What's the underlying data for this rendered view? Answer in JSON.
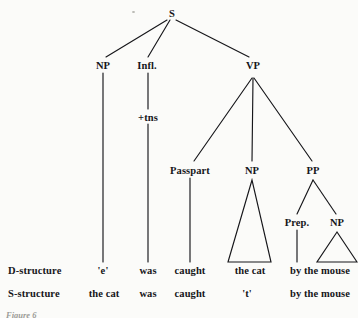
{
  "figure": {
    "caption": "Figure 6",
    "ink_color": "#16161a",
    "background_color": "#fbfbf9"
  },
  "tree": {
    "nodes": [
      {
        "id": "s",
        "label": "S",
        "x": 172,
        "y": 13
      },
      {
        "id": "np1",
        "label": "NP",
        "x": 103,
        "y": 65
      },
      {
        "id": "infl",
        "label": "Infl.",
        "x": 147,
        "y": 65
      },
      {
        "id": "vp",
        "label": "VP",
        "x": 253,
        "y": 65
      },
      {
        "id": "tns",
        "label": "+tns",
        "x": 148,
        "y": 117
      },
      {
        "id": "passpart",
        "label": "Passpart",
        "x": 190,
        "y": 170
      },
      {
        "id": "np2",
        "label": "NP",
        "x": 252,
        "y": 170
      },
      {
        "id": "pp",
        "label": "PP",
        "x": 313,
        "y": 170
      },
      {
        "id": "prep",
        "label": "Prep.",
        "x": 297,
        "y": 222
      },
      {
        "id": "np3",
        "label": "NP",
        "x": 337,
        "y": 222
      }
    ],
    "edges": [
      {
        "from": "s",
        "to": "np1",
        "x1": 167,
        "y1": 20,
        "x2": 106,
        "y2": 57
      },
      {
        "from": "s",
        "to": "infl",
        "x1": 170,
        "y1": 20,
        "x2": 148,
        "y2": 57
      },
      {
        "from": "s",
        "to": "vp",
        "x1": 176,
        "y1": 20,
        "x2": 249,
        "y2": 57
      },
      {
        "from": "np1",
        "to": "e",
        "x1": 103,
        "y1": 73,
        "x2": 103,
        "y2": 262
      },
      {
        "from": "infl",
        "to": "tns",
        "x1": 148,
        "y1": 73,
        "x2": 148,
        "y2": 109
      },
      {
        "from": "tns",
        "to": "was",
        "x1": 148,
        "y1": 124,
        "x2": 148,
        "y2": 262
      },
      {
        "from": "vp",
        "to": "passpart",
        "x1": 252,
        "y1": 78,
        "x2": 194,
        "y2": 161
      },
      {
        "from": "vp",
        "to": "np2",
        "x1": 253,
        "y1": 78,
        "x2": 252,
        "y2": 161
      },
      {
        "from": "vp",
        "to": "pp",
        "x1": 254,
        "y1": 78,
        "x2": 312,
        "y2": 161
      },
      {
        "from": "passpart",
        "to": "caught",
        "x1": 190,
        "y1": 178,
        "x2": 190,
        "y2": 262
      },
      {
        "from": "pp",
        "to": "prep",
        "x1": 313,
        "y1": 180,
        "x2": 297,
        "y2": 214
      },
      {
        "from": "pp",
        "to": "np3",
        "x1": 313,
        "y1": 180,
        "x2": 336,
        "y2": 214
      },
      {
        "from": "prep",
        "to": "by",
        "x1": 297,
        "y1": 230,
        "x2": 297,
        "y2": 262
      }
    ],
    "triangles": [
      {
        "id": "np2-triangle",
        "apex_x": 252,
        "apex_y": 180,
        "left_x": 228,
        "right_x": 271,
        "base_y": 262
      },
      {
        "id": "np3-triangle",
        "apex_x": 337,
        "apex_y": 232,
        "left_x": 317,
        "right_x": 357,
        "base_y": 262
      }
    ]
  },
  "rows": [
    {
      "id": "d-structure",
      "label": "D-structure",
      "label_x": 8,
      "y": 270,
      "cells": [
        {
          "text": "'e'",
          "x": 103
        },
        {
          "text": "was",
          "x": 148
        },
        {
          "text": "caught",
          "x": 190
        },
        {
          "text": "the cat",
          "x": 250
        },
        {
          "text": "by the mouse",
          "x": 320
        }
      ]
    },
    {
      "id": "s-structure",
      "label": "S-structure",
      "label_x": 8,
      "y": 293,
      "cells": [
        {
          "text": "the cat",
          "x": 104
        },
        {
          "text": "was",
          "x": 148
        },
        {
          "text": "caught",
          "x": 190
        },
        {
          "text": "'t'",
          "x": 247
        },
        {
          "text": "by the mouse",
          "x": 320
        }
      ]
    }
  ]
}
